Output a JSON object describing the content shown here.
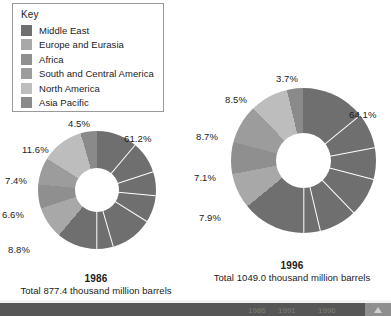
{
  "legend": {
    "title": "Key",
    "items": [
      {
        "label": "Middle East",
        "color": "#6f6f6f"
      },
      {
        "label": "Europe and Eurasia",
        "color": "#a8a8a8"
      },
      {
        "label": "Africa",
        "color": "#8f8f8f"
      },
      {
        "label": "South and Central America",
        "color": "#9c9c9c"
      },
      {
        "label": "North America",
        "color": "#bdbdbd"
      },
      {
        "label": "Asia Pacific",
        "color": "#8a8a8a"
      }
    ]
  },
  "chart_data": [
    {
      "type": "pie",
      "title": "1986",
      "subtitle": "Total 877.4 thousand million barrels",
      "total_label": "877.4 thousand million barrels",
      "categories": [
        "Middle East",
        "Europe and Eurasia",
        "Africa",
        "South and Central America",
        "North America",
        "Asia Pacific"
      ],
      "values": [
        61.2,
        8.8,
        6.6,
        7.4,
        11.6,
        4.5
      ],
      "labels": [
        "61.2%",
        "8.8%",
        "6.6%",
        "7.4%",
        "11.6%",
        "4.5%"
      ],
      "colors": [
        "#6f6f6f",
        "#a8a8a8",
        "#8f8f8f",
        "#9c9c9c",
        "#bdbdbd",
        "#8a8a8a"
      ],
      "donut": true,
      "legend": "top-left"
    },
    {
      "type": "pie",
      "title": "1996",
      "subtitle": "Total 1049.0 thousand million barrels",
      "total_label": "1049.0 thousand million barrels",
      "categories": [
        "Middle East",
        "Europe and Eurasia",
        "Africa",
        "South and Central America",
        "North America",
        "Asia Pacific"
      ],
      "values": [
        64.1,
        7.9,
        7.1,
        8.7,
        8.5,
        3.7
      ],
      "labels": [
        "64.1%",
        "7.9%",
        "7.1%",
        "8.7%",
        "8.5%",
        "3.7%"
      ],
      "colors": [
        "#6f6f6f",
        "#a8a8a8",
        "#8f8f8f",
        "#9c9c9c",
        "#bdbdbd",
        "#8a8a8a"
      ],
      "donut": true,
      "legend": "top-left"
    }
  ],
  "charts": {
    "left": {
      "year": "1986",
      "total": "Total 877.4 thousand million barrels",
      "pct": {
        "p1": "61.2%",
        "p2": "8.8%",
        "p3": "6.6%",
        "p4": "7.4%",
        "p5": "11.6%",
        "p6": "4.5%"
      }
    },
    "right": {
      "year": "1996",
      "total": "Total 1049.0 thousand million barrels",
      "pct": {
        "p1": "64.1%",
        "p2": "7.9%",
        "p3": "7.1%",
        "p4": "8.7%",
        "p5": "8.5%",
        "p6": "3.7%"
      }
    }
  },
  "bottom_strip": {
    "cell_a": "1986",
    "cell_b": "1991",
    "cell_c": "1996"
  }
}
